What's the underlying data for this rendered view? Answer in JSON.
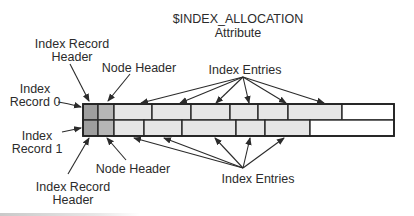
{
  "title": {
    "line1": "$INDEX_ALLOCATION",
    "line2": "Attribute"
  },
  "labels": {
    "top_record_header": [
      "Index Record",
      "Header"
    ],
    "top_node_header": "Node Header",
    "top_index_entries": "Index Entries",
    "record0": [
      "Index",
      "Record 0"
    ],
    "record1": [
      "Index",
      "Record 1"
    ],
    "bottom_node_header": "Node Header",
    "bottom_index_entries": "Index Entries",
    "bottom_record_header": [
      "Index Record",
      "Header"
    ]
  },
  "records": [
    {
      "name": "Index Record 0",
      "cells": [
        {
          "kind": "record-header"
        },
        {
          "kind": "node-header"
        },
        {
          "kind": "entry"
        },
        {
          "kind": "entry"
        },
        {
          "kind": "entry"
        },
        {
          "kind": "entry"
        },
        {
          "kind": "entry"
        },
        {
          "kind": "entry"
        },
        {
          "kind": "free"
        }
      ]
    },
    {
      "name": "Index Record 1",
      "cells": [
        {
          "kind": "record-header"
        },
        {
          "kind": "node-header"
        },
        {
          "kind": "entry"
        },
        {
          "kind": "entry"
        },
        {
          "kind": "entry"
        },
        {
          "kind": "entry"
        },
        {
          "kind": "entry"
        },
        {
          "kind": "free"
        }
      ]
    }
  ],
  "colors": {
    "record-header": "#9e9e9e",
    "node-header": "#b6b6b6",
    "entry": "#e6e6e6",
    "free": "#ffffff",
    "ink": "#2b2b2b"
  }
}
